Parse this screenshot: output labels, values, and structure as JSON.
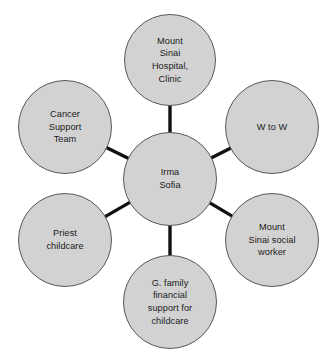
{
  "diagram": {
    "type": "ecomap-hub-and-spoke",
    "title": "",
    "colors": {
      "node_fill": "#d2d2d2",
      "node_stroke": "#59595b",
      "edge": "#111111",
      "text": "#1a1a1a",
      "background": "#ffffff"
    },
    "center_node": {
      "id": "center",
      "label": "Irma\nSofia",
      "cx": 170,
      "cy": 179,
      "r": 47
    },
    "nodes": [
      {
        "id": "mount-sinai-hospital-clinic",
        "label": "Mount\nSinai\nHospital,\nClinic",
        "cx": 170,
        "cy": 60,
        "r": 46
      },
      {
        "id": "w-to-w",
        "label": "W to W",
        "cx": 272,
        "cy": 127,
        "r": 47
      },
      {
        "id": "mount-sinai-social-worker",
        "label": "Mount\nSinai social\nworker",
        "cx": 272,
        "cy": 240,
        "r": 47
      },
      {
        "id": "g-family-financial-support-for-childcare",
        "label": "G. family\nfinancial\nsupport for\nchildcare",
        "cx": 170,
        "cy": 302,
        "r": 47
      },
      {
        "id": "priest-childcare",
        "label": "Priest\nchildcare",
        "cx": 65,
        "cy": 240,
        "r": 47
      },
      {
        "id": "cancer-support-team",
        "label": "Cancer\nSupport\nTeam",
        "cx": 65,
        "cy": 127,
        "r": 47
      }
    ],
    "edges": [
      {
        "from": "center",
        "to": "mount-sinai-hospital-clinic"
      },
      {
        "from": "center",
        "to": "w-to-w"
      },
      {
        "from": "center",
        "to": "mount-sinai-social-worker"
      },
      {
        "from": "center",
        "to": "g-family-financial-support-for-childcare"
      },
      {
        "from": "center",
        "to": "priest-childcare"
      },
      {
        "from": "center",
        "to": "cancer-support-team"
      }
    ]
  }
}
